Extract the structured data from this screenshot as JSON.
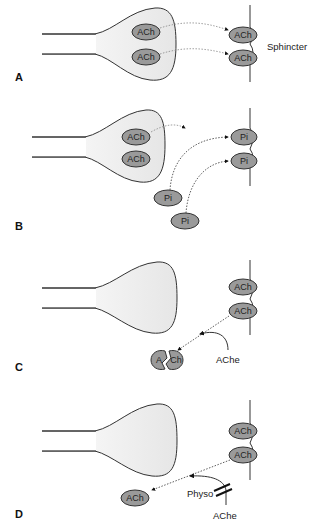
{
  "colors": {
    "terminal_fill": "#ededed",
    "vesicle_fill": "#9a9a9a",
    "stroke": "#333333",
    "background": "#ffffff"
  },
  "panels": [
    {
      "letter": "A",
      "membrane_label": "Sphincter",
      "terminal_vesicles": [
        "ACh",
        "ACh"
      ],
      "receptor_bound": [
        "ACh",
        "ACh"
      ]
    },
    {
      "letter": "B",
      "terminal_vesicles": [
        "ACh",
        "ACh"
      ],
      "receptor_bound": [
        "Pi",
        "Pi"
      ],
      "free_molecules": [
        "Pi",
        "Pi"
      ]
    },
    {
      "letter": "C",
      "receptor_bound": [
        "ACh",
        "ACh"
      ],
      "split_molecule": {
        "left": "A",
        "right": "Ch"
      },
      "enzyme_label": "AChe"
    },
    {
      "letter": "D",
      "receptor_bound": [
        "ACh",
        "ACh"
      ],
      "free_molecule": "ACh",
      "inhibitor_label": "Physo",
      "enzyme_label": "AChe"
    }
  ]
}
